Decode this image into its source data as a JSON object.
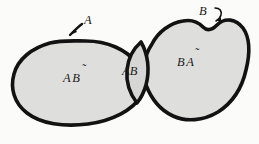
{
  "figure": {
    "background_color": "#fbfbfa",
    "fill_color": "#dededc",
    "outline_color": "#121212"
  },
  "sets": {
    "left": {
      "callout_label": "A",
      "region_label": "AB̃",
      "region_label_base": "A",
      "region_label_complement": "B"
    },
    "right": {
      "callout_label": "B",
      "region_label": "BÃ",
      "region_label_base": "B",
      "region_label_complement": "A"
    },
    "intersection": {
      "region_label": "AB"
    }
  },
  "labels": [
    {
      "name": "left-only-region",
      "text": "AB̃"
    },
    {
      "name": "intersection-region",
      "text": "AB"
    },
    {
      "name": "right-only-region",
      "text": "BÃ"
    },
    {
      "name": "set-a-callout",
      "text": "A"
    },
    {
      "name": "set-b-callout",
      "text": "B"
    }
  ]
}
